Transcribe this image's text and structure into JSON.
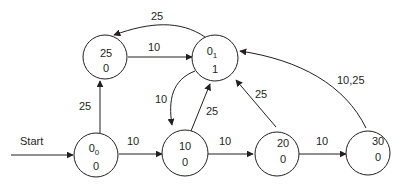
{
  "diagram": {
    "type": "state-machine",
    "start_label": "Start",
    "colors": {
      "stroke": "#231f20",
      "background": "#ffffff"
    },
    "nodes": [
      {
        "id": "0_0",
        "top": "0",
        "top_sub": "0",
        "bottom": "0"
      },
      {
        "id": "25",
        "top": "25",
        "top_sub": "",
        "bottom": "0"
      },
      {
        "id": "0_1",
        "top": "0",
        "top_sub": "1",
        "bottom": "1"
      },
      {
        "id": "10",
        "top": "10",
        "top_sub": "",
        "bottom": "0"
      },
      {
        "id": "20",
        "top": "20",
        "top_sub": "",
        "bottom": "0"
      },
      {
        "id": "30",
        "top": "30",
        "top_sub": "",
        "bottom": "0"
      }
    ],
    "edges": [
      {
        "from": "start",
        "to": "0_0",
        "label": "Start"
      },
      {
        "from": "0_0",
        "to": "25",
        "label": "25"
      },
      {
        "from": "0_0",
        "to": "10",
        "label": "10"
      },
      {
        "from": "25",
        "to": "0_1",
        "label": "10"
      },
      {
        "from": "0_1",
        "to": "25",
        "label": "25"
      },
      {
        "from": "0_1",
        "to": "10",
        "label": "10"
      },
      {
        "from": "10",
        "to": "0_1",
        "label": "25"
      },
      {
        "from": "10",
        "to": "20",
        "label": "10"
      },
      {
        "from": "20",
        "to": "0_1",
        "label": "25"
      },
      {
        "from": "20",
        "to": "30",
        "label": "10"
      },
      {
        "from": "30",
        "to": "0_1",
        "label": "10,25"
      }
    ]
  }
}
